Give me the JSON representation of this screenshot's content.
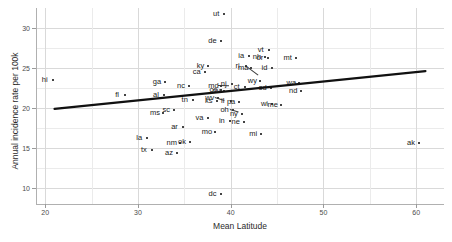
{
  "chart_data": {
    "type": "scatter",
    "title": "",
    "xlabel": "Mean Latitude",
    "ylabel": "Annual incidence rate per 100k",
    "xlim": [
      19.0,
      63.0
    ],
    "ylim": [
      8.0,
      32.5
    ],
    "xticks": [
      20,
      30,
      40,
      50,
      60
    ],
    "yticks": [
      10,
      15,
      20,
      25,
      30
    ],
    "grid": true,
    "legend": "none",
    "trendline": {
      "type": "linear",
      "x_start": 21.0,
      "y_start": 19.9,
      "x_end": 61.0,
      "y_end": 24.6
    },
    "point_label_field": "state",
    "points": [
      {
        "state": "hi",
        "x": 20.8,
        "y": 23.5
      },
      {
        "state": "fl",
        "x": 28.6,
        "y": 21.6
      },
      {
        "state": "la",
        "x": 31.0,
        "y": 16.2
      },
      {
        "state": "tx",
        "x": 31.5,
        "y": 14.7
      },
      {
        "state": "ms",
        "x": 32.7,
        "y": 19.4
      },
      {
        "state": "al",
        "x": 32.8,
        "y": 21.6
      },
      {
        "state": "ga",
        "x": 32.9,
        "y": 23.3
      },
      {
        "state": "sc",
        "x": 33.9,
        "y": 19.7
      },
      {
        "state": "az",
        "x": 34.2,
        "y": 14.4
      },
      {
        "state": "nm",
        "x": 34.5,
        "y": 15.6
      },
      {
        "state": "nc",
        "x": 35.5,
        "y": 22.8
      },
      {
        "state": "ar",
        "x": 34.8,
        "y": 17.6
      },
      {
        "state": "ok",
        "x": 35.6,
        "y": 15.7
      },
      {
        "state": "tn",
        "x": 35.9,
        "y": 21.0
      },
      {
        "state": "ca",
        "x": 37.2,
        "y": 24.5
      },
      {
        "state": "va",
        "x": 37.5,
        "y": 18.8
      },
      {
        "state": "ky",
        "x": 37.6,
        "y": 25.3
      },
      {
        "state": "mo",
        "x": 38.3,
        "y": 17.0
      },
      {
        "state": "md",
        "x": 39.0,
        "y": 22.8
      },
      {
        "state": "wv",
        "x": 38.6,
        "y": 21.3
      },
      {
        "state": "co",
        "x": 39.0,
        "y": 22.3
      },
      {
        "state": "ut",
        "x": 39.3,
        "y": 31.8
      },
      {
        "state": "oh",
        "x": 40.2,
        "y": 19.8
      },
      {
        "state": "il",
        "x": 40.0,
        "y": 20.9
      },
      {
        "state": "in",
        "x": 39.9,
        "y": 18.4
      },
      {
        "state": "ks",
        "x": 38.5,
        "y": 20.9
      },
      {
        "state": "nj",
        "x": 40.1,
        "y": 23.0
      },
      {
        "state": "ct",
        "x": 41.5,
        "y": 22.6
      },
      {
        "state": "pa",
        "x": 40.9,
        "y": 20.7
      },
      {
        "state": "ri",
        "x": 41.6,
        "y": 25.2
      },
      {
        "state": "ny",
        "x": 41.2,
        "y": 19.3
      },
      {
        "state": "ne",
        "x": 41.4,
        "y": 18.3
      },
      {
        "state": "ia",
        "x": 42.0,
        "y": 26.5
      },
      {
        "state": "ma",
        "x": 42.2,
        "y": 25.0
      },
      {
        "state": "de",
        "x": 38.9,
        "y": 28.4
      },
      {
        "state": "nv",
        "x": 39.3,
        "y": 22.1
      },
      {
        "state": "mi",
        "x": 43.3,
        "y": 16.7
      },
      {
        "state": "sd",
        "x": 44.3,
        "y": 22.5
      },
      {
        "state": "wi",
        "x": 44.5,
        "y": 20.5
      },
      {
        "state": "nh",
        "x": 43.7,
        "y": 26.4
      },
      {
        "state": "or",
        "x": 44.0,
        "y": 26.2
      },
      {
        "state": "vt",
        "x": 44.1,
        "y": 27.3
      },
      {
        "state": "id",
        "x": 44.5,
        "y": 25.0
      },
      {
        "state": "wy",
        "x": 43.2,
        "y": 23.4
      },
      {
        "state": "me",
        "x": 45.4,
        "y": 20.4
      },
      {
        "state": "mt",
        "x": 47.0,
        "y": 26.2
      },
      {
        "state": "wa",
        "x": 47.4,
        "y": 23.1
      },
      {
        "state": "nd",
        "x": 47.6,
        "y": 22.1
      },
      {
        "state": "dc",
        "x": 38.9,
        "y": 9.3
      },
      {
        "state": "ak",
        "x": 60.3,
        "y": 15.6
      }
    ],
    "leader_lines": [
      {
        "from_label": "md",
        "to_x": 40.0,
        "to_y": 22.9
      },
      {
        "from_label": "oh",
        "to_x": 40.9,
        "to_y": 19.4
      },
      {
        "from_label": "ma",
        "to_x": 43.0,
        "to_y": 23.7
      },
      {
        "from_label": "wv",
        "to_x": 39.4,
        "to_y": 20.8
      }
    ]
  },
  "axes": {
    "x_title": "Mean Latitude",
    "y_title": "Annual incidence rate per 100k",
    "x_tick_labels": [
      "20",
      "30",
      "40",
      "50",
      "60"
    ],
    "y_tick_labels": [
      "10",
      "15",
      "20",
      "25",
      "30"
    ]
  },
  "colors": {
    "background": "#ffffff",
    "point": "#444444",
    "label_text": "#1a1a1a",
    "grid": "#d9d9d9",
    "axis": "#b0b0b0",
    "trendline": "#111111"
  }
}
